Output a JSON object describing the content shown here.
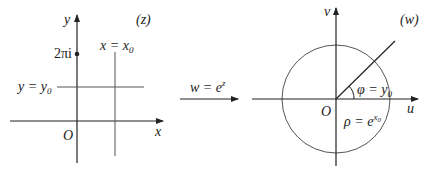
{
  "z_plane": {
    "label": "(z)",
    "x_axis_label": "x",
    "y_axis_label": "y",
    "origin_label": "O",
    "point_label": "2πi",
    "horizontal_line_label": "y = y",
    "horizontal_line_sub": "0",
    "vertical_line_label": "x = x",
    "vertical_line_sub": "0"
  },
  "mapping": {
    "label_lhs": "w = e",
    "label_exp": "z"
  },
  "w_plane": {
    "label": "(w)",
    "u_axis_label": "u",
    "v_axis_label": "v",
    "origin_label": "O",
    "angle_label": "φ = y",
    "angle_sub": "0",
    "radius_label": "ρ = e",
    "radius_exp": "x",
    "radius_exp_sub": "0"
  },
  "colors": {
    "axis": "#222222",
    "line": "#555555"
  }
}
